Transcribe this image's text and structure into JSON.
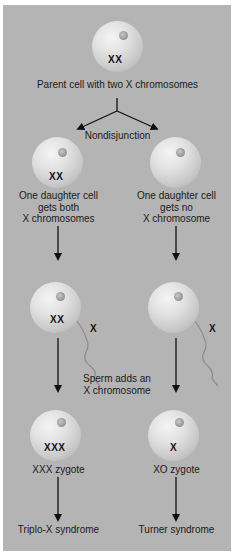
{
  "diagram": {
    "parent": {
      "chromosomes": "XX",
      "label": "Parent cell with two X chromosomes"
    },
    "process_label": "Nondisjunction",
    "left_daughter": {
      "chromosomes": "XX",
      "label_lines": [
        "One daughter cell",
        "gets both",
        "X chromosomes"
      ]
    },
    "right_daughter": {
      "chromosomes": "",
      "label_lines": [
        "One daughter cell",
        "gets no",
        "X chromosome"
      ]
    },
    "fertilization": {
      "left_egg_chromosomes": "XX",
      "left_sperm_chromosome": "X",
      "right_egg_chromosomes": "",
      "right_sperm_chromosome": "X",
      "label_lines": [
        "Sperm adds an",
        "X chromosome"
      ]
    },
    "left_zygote": {
      "chromosomes": "XXX",
      "label": "XXX zygote",
      "outcome": "Triplo-X syndrome"
    },
    "right_zygote": {
      "chromosomes": "X",
      "label": "XO zygote",
      "outcome": "Turner syndrome"
    },
    "colors": {
      "background": "#b4b4b4",
      "text": "#1a1a1a",
      "arrow": "#111111"
    }
  }
}
